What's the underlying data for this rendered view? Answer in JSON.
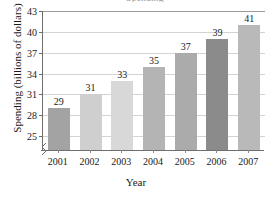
{
  "chart_data": {
    "type": "bar",
    "title": "Spending",
    "xlabel": "Year",
    "ylabel": "Spending (billions of dollars)",
    "categories": [
      "2001",
      "2002",
      "2003",
      "2004",
      "2005",
      "2006",
      "2007"
    ],
    "values": [
      29,
      31,
      33,
      35,
      37,
      39,
      41
    ],
    "value_labels": [
      "29",
      "31",
      "33",
      "35",
      "37",
      "39",
      "41"
    ],
    "bar_colors": [
      "#a3a3a3",
      "#cfcfcf",
      "#d8d8d8",
      "#b4b4b4",
      "#ababab",
      "#8b8b8b",
      "#b9b9b9"
    ],
    "ylim": [
      23,
      43
    ],
    "yticks": [
      25,
      28,
      31,
      34,
      37,
      40,
      43
    ],
    "ytick_labels": [
      "25",
      "28",
      "31",
      "34",
      "37",
      "40",
      "43"
    ],
    "grid": "horizontal",
    "legend": "none",
    "axis_break": true
  }
}
